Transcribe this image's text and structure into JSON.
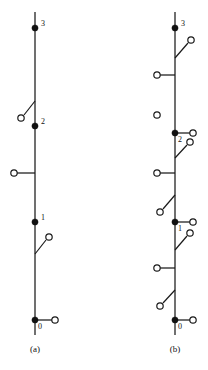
{
  "figure": {
    "width": 208,
    "height": 370,
    "background_color": "#ffffff",
    "line_color": "#1a1a1a",
    "filled_node_color": "#111111",
    "open_node_fill": "#ffffff"
  },
  "panels": [
    {
      "id": "a",
      "caption": "(a)",
      "rail": {
        "x": 35,
        "y_top": 12,
        "y_bottom": 335
      },
      "nodes": [
        {
          "name": "node-3",
          "label": "3",
          "x": 35,
          "y": 28,
          "type": "filled",
          "label_dx": 6,
          "label_dy": -2
        },
        {
          "name": "node-2",
          "label": "2",
          "x": 35,
          "y": 126,
          "type": "filled",
          "label_dx": 6,
          "label_dy": -2
        },
        {
          "name": "node-1",
          "label": "1",
          "x": 35,
          "y": 222,
          "type": "filled",
          "label_dx": 6,
          "label_dy": -2
        },
        {
          "name": "node-0",
          "label": "0",
          "x": 35,
          "y": 320,
          "type": "filled",
          "label_dx": 3,
          "label_dy": 9
        }
      ],
      "stubs": [
        {
          "name": "stub-left-mid",
          "x1": 35,
          "y1": 173,
          "x2": 17,
          "y2": 173,
          "terminal_x": 14,
          "terminal_y": 173
        },
        {
          "name": "stub-right-node-0",
          "x1": 35,
          "y1": 320,
          "x2": 52,
          "y2": 320,
          "terminal_x": 55,
          "terminal_y": 320
        }
      ],
      "switches": [
        {
          "name": "switch-above-node-2",
          "x1": 35,
          "y1": 101,
          "x2": 24,
          "y2": 115,
          "terminal_x": 21,
          "terminal_y": 118
        },
        {
          "name": "switch-below-node-1",
          "x1": 35,
          "y1": 254,
          "x2": 46,
          "y2": 240,
          "terminal_x": 49,
          "terminal_y": 237
        }
      ],
      "isolated_terminals": []
    },
    {
      "id": "b",
      "caption": "(b)",
      "rail": {
        "x": 175,
        "y_top": 12,
        "y_bottom": 335
      },
      "nodes": [
        {
          "name": "node-3",
          "label": "3",
          "x": 175,
          "y": 28,
          "type": "filled",
          "label_dx": 6,
          "label_dy": -2
        },
        {
          "name": "node-2",
          "label": "2",
          "x": 175,
          "y": 133,
          "type": "filled",
          "label_dx": 3,
          "label_dy": 9
        },
        {
          "name": "node-1",
          "label": "1",
          "x": 175,
          "y": 222,
          "type": "filled",
          "label_dx": 3,
          "label_dy": 9
        },
        {
          "name": "node-0",
          "label": "0",
          "x": 175,
          "y": 320,
          "type": "filled",
          "label_dx": 3,
          "label_dy": 9
        }
      ],
      "stubs": [
        {
          "name": "stub-left-upper",
          "x1": 175,
          "y1": 75,
          "x2": 160,
          "y2": 75,
          "terminal_x": 157,
          "terminal_y": 75
        },
        {
          "name": "stub-right-node-2",
          "x1": 175,
          "y1": 133,
          "x2": 190,
          "y2": 133,
          "terminal_x": 193,
          "terminal_y": 133
        },
        {
          "name": "stub-left-mid",
          "x1": 175,
          "y1": 173,
          "x2": 160,
          "y2": 173,
          "terminal_x": 157,
          "terminal_y": 173
        },
        {
          "name": "stub-right-node-1",
          "x1": 175,
          "y1": 222,
          "x2": 190,
          "y2": 222,
          "terminal_x": 193,
          "terminal_y": 222
        },
        {
          "name": "stub-left-lower",
          "x1": 175,
          "y1": 268,
          "x2": 160,
          "y2": 268,
          "terminal_x": 157,
          "terminal_y": 268
        },
        {
          "name": "stub-right-node-0",
          "x1": 175,
          "y1": 320,
          "x2": 190,
          "y2": 320,
          "terminal_x": 193,
          "terminal_y": 320
        }
      ],
      "switches": [
        {
          "name": "switch-below-node-3",
          "x1": 175,
          "y1": 58,
          "x2": 188,
          "y2": 43,
          "terminal_x": 191,
          "terminal_y": 40
        },
        {
          "name": "switch-below-node-2",
          "x1": 175,
          "y1": 158,
          "x2": 187,
          "y2": 145,
          "terminal_x": 190,
          "terminal_y": 142
        },
        {
          "name": "switch-above-node-1",
          "x1": 175,
          "y1": 195,
          "x2": 163,
          "y2": 209,
          "terminal_x": 160,
          "terminal_y": 212
        },
        {
          "name": "switch-below-node-1",
          "x1": 175,
          "y1": 250,
          "x2": 187,
          "y2": 236,
          "terminal_x": 190,
          "terminal_y": 233
        },
        {
          "name": "switch-above-node-0",
          "x1": 175,
          "y1": 290,
          "x2": 163,
          "y2": 303,
          "terminal_x": 160,
          "terminal_y": 306
        }
      ],
      "isolated_terminals": [
        {
          "name": "isolated-terminal-upper-left",
          "x": 157,
          "y": 115
        }
      ]
    }
  ],
  "geometry": {
    "filled_node_radius": 3.1,
    "open_node_radius": 3.2
  }
}
